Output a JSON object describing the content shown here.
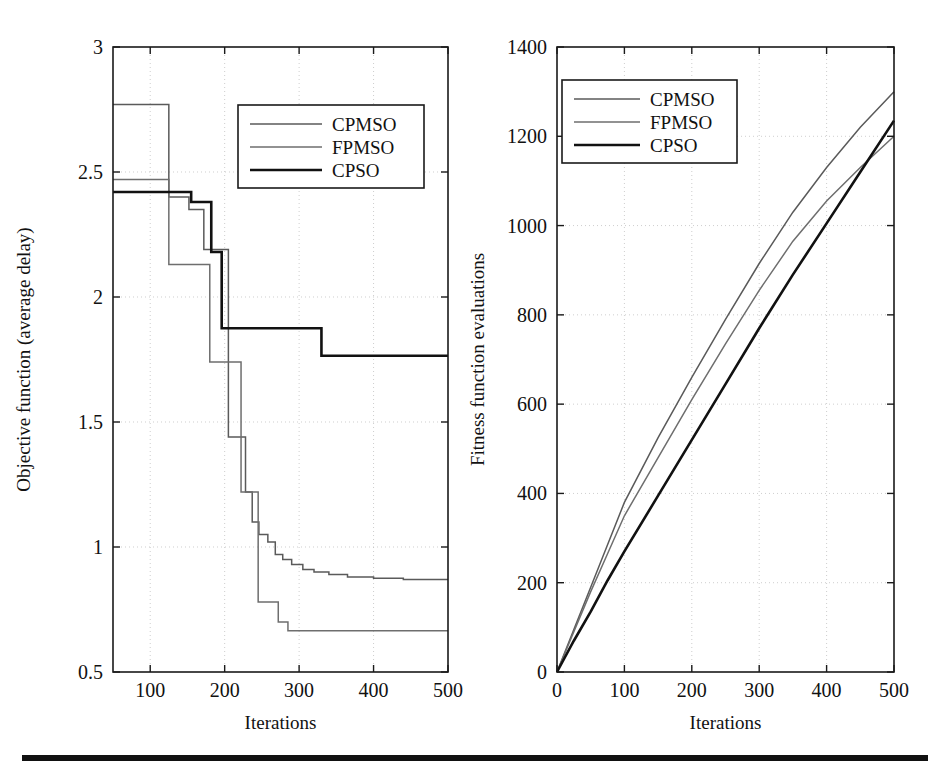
{
  "figure": {
    "background": "#ffffff",
    "rule_color": "#111111",
    "series_colors": {
      "CPMSO": "#5a5a5a",
      "FPMSO": "#6e6e6e",
      "CPSO": "#111111"
    },
    "series_widths": {
      "CPMSO": 1.5,
      "FPMSO": 1.5,
      "CPSO": 2.6
    }
  },
  "chart_data": [
    {
      "id": "objective-function-chart",
      "type": "line",
      "title": "",
      "xlabel": "Iterations",
      "ylabel": "Objective function (average delay)",
      "xlim": [
        50,
        500
      ],
      "ylim": [
        0.5,
        3
      ],
      "xticks": [
        100,
        200,
        300,
        400,
        500
      ],
      "yticks": [
        0.5,
        1,
        1.5,
        2,
        2.5,
        3
      ],
      "xticklabels": [
        "100",
        "200",
        "300",
        "400",
        "500"
      ],
      "yticklabels": [
        "0.5",
        "1",
        "1.5",
        "2",
        "2.5",
        "3"
      ],
      "grid": true,
      "legend_position": "upper-center",
      "step": "post",
      "series": [
        {
          "name": "CPMSO",
          "x": [
            50,
            125,
            152,
            160,
            172,
            180,
            196,
            205,
            212,
            228,
            237,
            246,
            258,
            268,
            278,
            290,
            305,
            320,
            340,
            365,
            400,
            440,
            500
          ],
          "y": [
            2.77,
            2.4,
            2.35,
            2.35,
            2.19,
            2.19,
            2.19,
            1.44,
            1.44,
            1.22,
            1.1,
            1.05,
            1.02,
            0.97,
            0.95,
            0.93,
            0.91,
            0.9,
            0.89,
            0.88,
            0.875,
            0.87,
            0.87
          ]
        },
        {
          "name": "FPMSO",
          "x": [
            50,
            125,
            150,
            165,
            180,
            196,
            205,
            222,
            232,
            245,
            258,
            272,
            285,
            330,
            400,
            500
          ],
          "y": [
            2.47,
            2.13,
            2.13,
            2.13,
            1.74,
            1.74,
            1.74,
            1.22,
            1.22,
            0.78,
            0.78,
            0.7,
            0.665,
            0.665,
            0.665,
            0.665
          ]
        },
        {
          "name": "CPSO",
          "x": [
            50,
            140,
            155,
            170,
            182,
            196,
            330,
            400,
            500
          ],
          "y": [
            2.42,
            2.42,
            2.38,
            2.38,
            2.18,
            1.875,
            1.765,
            1.765,
            1.765
          ]
        }
      ]
    },
    {
      "id": "fitness-evaluations-chart",
      "type": "line",
      "title": "",
      "xlabel": "Iterations",
      "ylabel": "Fitness function evaluations",
      "xlim": [
        0,
        500
      ],
      "ylim": [
        0,
        1400
      ],
      "xticks": [
        0,
        100,
        200,
        300,
        400,
        500
      ],
      "yticks": [
        0,
        200,
        400,
        600,
        800,
        1000,
        1200,
        1400
      ],
      "xticklabels": [
        "0",
        "100",
        "200",
        "300",
        "400",
        "500"
      ],
      "yticklabels": [
        "0",
        "200",
        "400",
        "600",
        "800",
        "1000",
        "1200",
        "1400"
      ],
      "grid": true,
      "legend_position": "upper-left",
      "step": "none",
      "series": [
        {
          "name": "CPMSO",
          "x": [
            0,
            25,
            50,
            75,
            100,
            150,
            200,
            250,
            300,
            350,
            400,
            450,
            500
          ],
          "y": [
            0,
            95,
            190,
            285,
            380,
            525,
            660,
            790,
            915,
            1030,
            1130,
            1220,
            1300
          ]
        },
        {
          "name": "FPMSO",
          "x": [
            0,
            25,
            50,
            75,
            100,
            150,
            200,
            250,
            300,
            350,
            400,
            450,
            500
          ],
          "y": [
            0,
            90,
            180,
            265,
            350,
            480,
            610,
            735,
            855,
            965,
            1055,
            1130,
            1200
          ]
        },
        {
          "name": "CPSO",
          "x": [
            0,
            25,
            50,
            75,
            100,
            150,
            200,
            250,
            300,
            350,
            400,
            450,
            500
          ],
          "y": [
            0,
            70,
            135,
            205,
            270,
            395,
            520,
            645,
            770,
            890,
            1005,
            1120,
            1235
          ]
        }
      ]
    }
  ],
  "legends": [
    {
      "id": "legend-left",
      "entries": [
        {
          "label": "CPMSO"
        },
        {
          "label": "FPMSO"
        },
        {
          "label": "CPSO"
        }
      ]
    },
    {
      "id": "legend-right",
      "entries": [
        {
          "label": "CPMSO"
        },
        {
          "label": "FPMSO"
        },
        {
          "label": "CPSO"
        }
      ]
    }
  ]
}
